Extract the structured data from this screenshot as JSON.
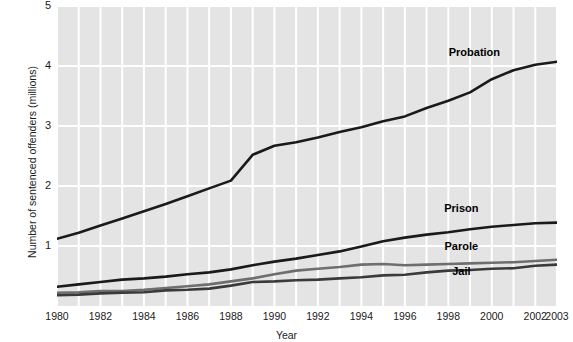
{
  "chart_data": {
    "type": "line",
    "title": "",
    "xlabel": "Year",
    "ylabel": "Number of sentenced offenders (millions)",
    "xlim": [
      1980,
      2003
    ],
    "ylim": [
      0,
      5
    ],
    "grid": true,
    "legend_position": "inline-labels",
    "x": [
      1980,
      1981,
      1982,
      1983,
      1984,
      1985,
      1986,
      1987,
      1988,
      1989,
      1990,
      1991,
      1992,
      1993,
      1994,
      1995,
      1996,
      1997,
      1998,
      1999,
      2000,
      2001,
      2002,
      2003
    ],
    "xticks": [
      {
        "value": 1980,
        "label": "1980"
      },
      {
        "value": 1982,
        "label": "1982"
      },
      {
        "value": 1984,
        "label": "1984"
      },
      {
        "value": 1986,
        "label": "1986"
      },
      {
        "value": 1988,
        "label": "1988"
      },
      {
        "value": 1990,
        "label": "1990"
      },
      {
        "value": 1992,
        "label": "1992"
      },
      {
        "value": 1994,
        "label": "1994"
      },
      {
        "value": 1996,
        "label": "1996"
      },
      {
        "value": 1998,
        "label": "1998"
      },
      {
        "value": 2000,
        "label": "2000"
      },
      {
        "value": 2002,
        "label": "2002"
      },
      {
        "value": 2003,
        "label": "2003"
      }
    ],
    "yticks": [
      {
        "value": 1,
        "label": "1"
      },
      {
        "value": 2,
        "label": "2"
      },
      {
        "value": 3,
        "label": "3"
      },
      {
        "value": 4,
        "label": "4"
      },
      {
        "value": 5,
        "label": "5"
      }
    ],
    "series": [
      {
        "name": "Probation",
        "color": "#1a1a1a",
        "width": 2.6,
        "label_x": 1999.2,
        "label_y": 4.22,
        "values": [
          1.12,
          1.22,
          1.34,
          1.46,
          1.58,
          1.7,
          1.83,
          1.96,
          2.09,
          2.52,
          2.67,
          2.73,
          2.81,
          2.9,
          2.98,
          3.08,
          3.16,
          3.3,
          3.42,
          3.56,
          3.78,
          3.93,
          4.02,
          4.07
        ]
      },
      {
        "name": "Prison",
        "color": "#1a1a1a",
        "width": 2.6,
        "label_x": 1998.6,
        "label_y": 1.62,
        "values": [
          0.32,
          0.36,
          0.4,
          0.44,
          0.46,
          0.49,
          0.53,
          0.56,
          0.61,
          0.68,
          0.74,
          0.79,
          0.85,
          0.91,
          0.99,
          1.08,
          1.14,
          1.19,
          1.23,
          1.28,
          1.32,
          1.35,
          1.38,
          1.39
        ]
      },
      {
        "name": "Parole",
        "color": "#6e6e6e",
        "width": 2.6,
        "label_x": 1998.6,
        "label_y": 0.98,
        "values": [
          0.22,
          0.23,
          0.25,
          0.25,
          0.27,
          0.3,
          0.33,
          0.36,
          0.41,
          0.46,
          0.53,
          0.59,
          0.62,
          0.65,
          0.69,
          0.7,
          0.68,
          0.69,
          0.7,
          0.71,
          0.72,
          0.73,
          0.75,
          0.77
        ]
      },
      {
        "name": "Jail",
        "color": "#3a3a3a",
        "width": 2.6,
        "label_x": 1998.6,
        "label_y": 0.56,
        "values": [
          0.18,
          0.19,
          0.21,
          0.22,
          0.23,
          0.26,
          0.27,
          0.29,
          0.34,
          0.4,
          0.41,
          0.43,
          0.44,
          0.46,
          0.48,
          0.51,
          0.52,
          0.56,
          0.59,
          0.6,
          0.62,
          0.63,
          0.67,
          0.69
        ]
      }
    ],
    "colors": {
      "plot_background": "#e4e4e4",
      "grid": "#ffffff",
      "text": "#1a1a1a",
      "page_background": "#ffffff"
    }
  }
}
